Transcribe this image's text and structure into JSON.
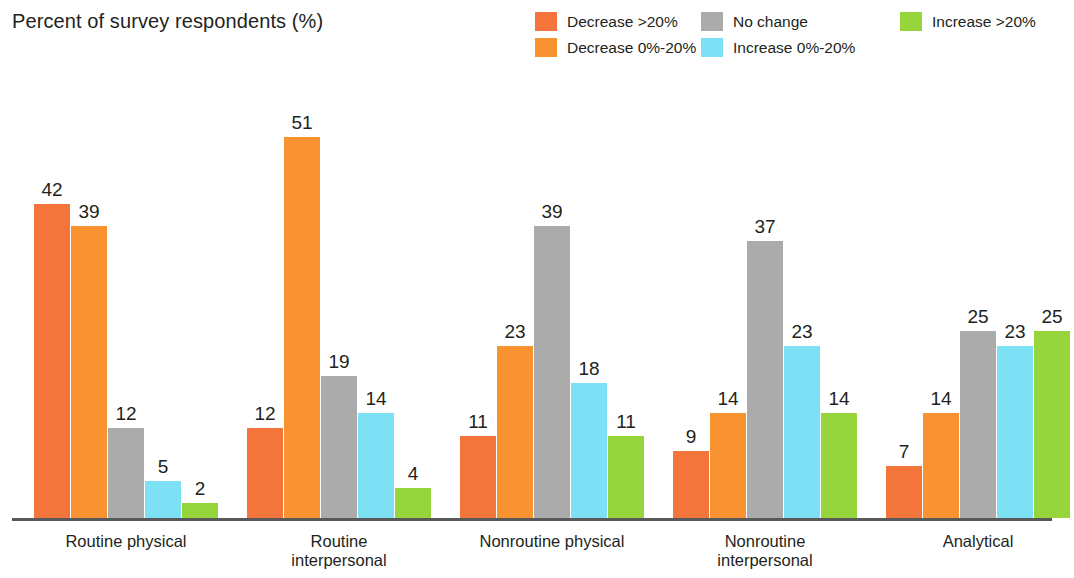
{
  "title": "Percent of survey respondents (%)",
  "legend": {
    "items": [
      {
        "label": "Decrease >20%",
        "color": "#F4753C",
        "row": 0,
        "col": 0
      },
      {
        "label": "Decrease 0%-20%",
        "color": "#F99230",
        "row": 1,
        "col": 0
      },
      {
        "label": "No change",
        "color": "#ABABAB",
        "row": 0,
        "col": 1
      },
      {
        "label": "Increase 0%-20%",
        "color": "#7EE0F5",
        "row": 1,
        "col": 1
      },
      {
        "label": "Increase >20%",
        "color": "#96D63C",
        "row": 0,
        "col": 2
      }
    ]
  },
  "chart_data": {
    "type": "bar",
    "title": "Percent of survey respondents (%)",
    "xlabel": "",
    "ylabel": "Percent of survey respondents (%)",
    "ylim": [
      0,
      51
    ],
    "grid": false,
    "legend_position": "top-right",
    "categories": [
      "Routine physical",
      "Routine\ninterpersonal",
      "Nonroutine physical",
      "Nonroutine\ninterpersonal",
      "Analytical"
    ],
    "series": [
      {
        "name": "Decrease >20%",
        "color": "#F4753C",
        "values": [
          42,
          12,
          11,
          9,
          7
        ]
      },
      {
        "name": "Decrease 0%-20%",
        "color": "#F99230",
        "values": [
          39,
          51,
          23,
          14,
          14
        ]
      },
      {
        "name": "No change",
        "color": "#ABABAB",
        "values": [
          12,
          19,
          39,
          37,
          25
        ]
      },
      {
        "name": "Increase 0%-20%",
        "color": "#7EE0F5",
        "values": [
          5,
          14,
          18,
          23,
          23
        ]
      },
      {
        "name": "Increase >20%",
        "color": "#96D63C",
        "values": [
          2,
          4,
          11,
          14,
          25
        ]
      }
    ]
  },
  "geometry": {
    "baseline_y": 518,
    "bar_width": 36,
    "bar_gap": 1,
    "group_gap": 28,
    "plot_left": 34,
    "unit_px": 7.48
  }
}
